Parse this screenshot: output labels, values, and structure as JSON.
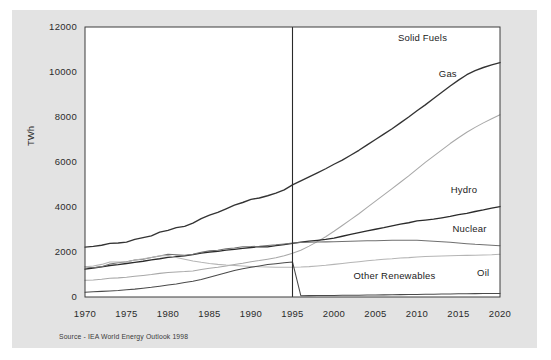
{
  "figure": {
    "source_note": "Source - IEA World Energy Outlook 1998",
    "background_color": "#e3e3e3",
    "plot_background_color": "#ffffff",
    "frame_color": "#3c3c3c"
  },
  "chart_data": {
    "type": "line",
    "title": "",
    "subtitle": "",
    "xlabel": "",
    "ylabel": "TWh",
    "xlim": [
      1970,
      2020
    ],
    "ylim": [
      0,
      12000
    ],
    "grid": false,
    "legend_position": "inline-right-labels",
    "xticks": [
      "1970",
      "1975",
      "1980",
      "1985",
      "1990",
      "1995",
      "2000",
      "2005",
      "2010",
      "2015",
      "2020"
    ],
    "xtick_values": [
      1970,
      1975,
      1980,
      1985,
      1990,
      1995,
      2000,
      2005,
      2010,
      2015,
      2020
    ],
    "yticks": [
      "0",
      "2000",
      "4000",
      "6000",
      "8000",
      "10000",
      "12000"
    ],
    "ytick_values": [
      0,
      2000,
      4000,
      6000,
      8000,
      10000,
      12000
    ],
    "annotations": [
      {
        "name": "forecast-divider",
        "type": "vline",
        "x": 1995,
        "label": ""
      }
    ],
    "x": [
      1970,
      1971,
      1972,
      1973,
      1974,
      1975,
      1976,
      1977,
      1978,
      1979,
      1980,
      1981,
      1982,
      1983,
      1984,
      1985,
      1986,
      1987,
      1988,
      1989,
      1990,
      1991,
      1992,
      1993,
      1994,
      1995,
      1996,
      1997,
      1998,
      1999,
      2000,
      2001,
      2002,
      2003,
      2004,
      2005,
      2006,
      2007,
      2008,
      2009,
      2010,
      2011,
      2012,
      2013,
      2014,
      2015,
      2016,
      2017,
      2018,
      2019,
      2020
    ],
    "series": [
      {
        "name": "Solid Fuels",
        "color": "#333333",
        "label": "Solid Fuels",
        "label_value": 10400,
        "values": [
          2220,
          2250,
          2300,
          2380,
          2400,
          2440,
          2560,
          2640,
          2720,
          2880,
          2960,
          3080,
          3140,
          3280,
          3480,
          3640,
          3760,
          3920,
          4080,
          4200,
          4340,
          4400,
          4500,
          4620,
          4760,
          4980,
          5160,
          5340,
          5520,
          5700,
          5900,
          6080,
          6300,
          6520,
          6760,
          7000,
          7240,
          7480,
          7740,
          8000,
          8280,
          8540,
          8820,
          9100,
          9380,
          9640,
          9880,
          10060,
          10200,
          10320,
          10420
        ]
      },
      {
        "name": "Gas",
        "color": "#a8a8a8",
        "label": "Gas",
        "label_value": 8100,
        "values": [
          740,
          760,
          790,
          830,
          850,
          880,
          920,
          960,
          1000,
          1050,
          1090,
          1110,
          1130,
          1160,
          1220,
          1280,
          1320,
          1380,
          1440,
          1500,
          1570,
          1620,
          1680,
          1740,
          1830,
          1940,
          2080,
          2260,
          2460,
          2680,
          2920,
          3180,
          3440,
          3700,
          3980,
          4260,
          4540,
          4820,
          5100,
          5380,
          5680,
          5980,
          6260,
          6540,
          6820,
          7080,
          7320,
          7540,
          7740,
          7920,
          8100
        ]
      },
      {
        "name": "Hydro",
        "color": "#2b2b2b",
        "label": "Hydro",
        "label_value": 4020,
        "values": [
          1240,
          1290,
          1340,
          1400,
          1440,
          1490,
          1540,
          1590,
          1650,
          1700,
          1760,
          1800,
          1830,
          1880,
          1950,
          2000,
          2030,
          2080,
          2120,
          2160,
          2200,
          2240,
          2230,
          2280,
          2330,
          2380,
          2440,
          2480,
          2520,
          2560,
          2620,
          2700,
          2780,
          2860,
          2940,
          3010,
          3080,
          3160,
          3240,
          3300,
          3380,
          3420,
          3460,
          3520,
          3580,
          3660,
          3720,
          3800,
          3870,
          3950,
          4020
        ]
      },
      {
        "name": "Nuclear",
        "color": "#707070",
        "label": "Nuclear",
        "label_value": 2280,
        "values": [
          1340,
          1300,
          1350,
          1470,
          1520,
          1570,
          1640,
          1680,
          1760,
          1820,
          1900,
          1880,
          1860,
          1900,
          1990,
          2050,
          2080,
          2140,
          2180,
          2230,
          2240,
          2260,
          2290,
          2320,
          2360,
          2400,
          2420,
          2430,
          2440,
          2450,
          2460,
          2470,
          2480,
          2490,
          2500,
          2500,
          2510,
          2520,
          2520,
          2520,
          2520,
          2500,
          2480,
          2460,
          2430,
          2400,
          2370,
          2340,
          2320,
          2300,
          2280
        ]
      },
      {
        "name": "Oil",
        "color": "#b5b5b5",
        "label": "Oil",
        "label_value": 1900,
        "values": [
          1340,
          1380,
          1450,
          1560,
          1560,
          1560,
          1640,
          1700,
          1760,
          1830,
          1840,
          1760,
          1680,
          1600,
          1540,
          1490,
          1450,
          1420,
          1400,
          1380,
          1360,
          1340,
          1330,
          1320,
          1320,
          1320,
          1330,
          1350,
          1380,
          1410,
          1450,
          1490,
          1530,
          1570,
          1610,
          1640,
          1680,
          1700,
          1730,
          1750,
          1780,
          1800,
          1810,
          1820,
          1830,
          1840,
          1850,
          1860,
          1870,
          1880,
          1900
        ]
      },
      {
        "name": "Other Renewables",
        "color": "#4a4a4a",
        "label": "Other Renewables",
        "label_value": 160,
        "values": [
          210,
          230,
          250,
          270,
          290,
          320,
          350,
          390,
          430,
          480,
          530,
          580,
          640,
          700,
          780,
          880,
          980,
          1080,
          1180,
          1260,
          1320,
          1380,
          1440,
          1480,
          1520,
          1560,
          60,
          62,
          64,
          66,
          70,
          74,
          78,
          82,
          86,
          90,
          95,
          100,
          105,
          110,
          115,
          120,
          126,
          131,
          136,
          141,
          146,
          150,
          154,
          157,
          160
        ]
      }
    ]
  }
}
